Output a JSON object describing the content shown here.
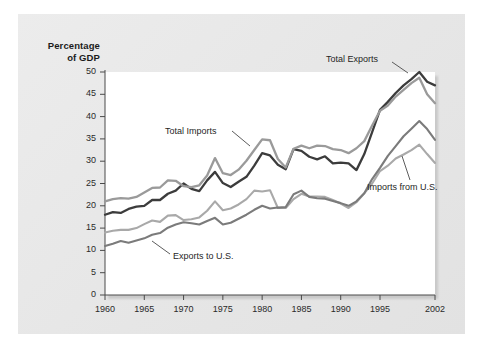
{
  "chart_data": {
    "type": "line",
    "title": "",
    "subtitle": "",
    "xlabel": "",
    "ylabel": "Percentage\nof GDP",
    "ylabel_lines": [
      "Percentage",
      "of GDP"
    ],
    "xlim": [
      1960,
      2002
    ],
    "ylim": [
      0,
      50
    ],
    "grid": false,
    "legend_position": "inline-annotations",
    "x_ticks": [
      1960,
      1965,
      1970,
      1975,
      1980,
      1985,
      1990,
      1995,
      2002
    ],
    "x_tick_labels": [
      "1960",
      "1965",
      "1970",
      "1975",
      "1980",
      "1985",
      "1990",
      "1995",
      "2002"
    ],
    "y_ticks": [
      0,
      5,
      10,
      15,
      20,
      25,
      30,
      35,
      40,
      45,
      50
    ],
    "y_tick_labels": [
      "0",
      "5",
      "10",
      "15",
      "20",
      "25",
      "30",
      "35",
      "40",
      "45",
      "50"
    ],
    "x": [
      1960,
      1961,
      1962,
      1963,
      1964,
      1965,
      1966,
      1967,
      1968,
      1969,
      1970,
      1971,
      1972,
      1973,
      1974,
      1975,
      1976,
      1977,
      1978,
      1979,
      1980,
      1981,
      1982,
      1983,
      1984,
      1985,
      1986,
      1987,
      1988,
      1989,
      1990,
      1991,
      1992,
      1993,
      1994,
      1995,
      1996,
      1997,
      1998,
      1999,
      2000,
      2001,
      2002
    ],
    "series": [
      {
        "name": "Total Exports",
        "color": "#3c3c3c",
        "width": 2.3,
        "values": [
          18.0,
          18.6,
          18.4,
          19.3,
          19.8,
          20.0,
          21.3,
          21.3,
          22.7,
          23.4,
          25.0,
          23.8,
          23.3,
          25.7,
          27.6,
          25.1,
          24.2,
          25.4,
          26.5,
          29.0,
          31.8,
          31.3,
          29.2,
          28.2,
          32.7,
          32.3,
          31.0,
          30.4,
          31.1,
          29.5,
          29.7,
          29.5,
          28.0,
          31.6,
          36.5,
          41.5,
          43.3,
          45.3,
          47.0,
          48.4,
          50.0,
          47.8,
          47.0
        ]
      },
      {
        "name": "Total Imports",
        "color": "#9a9a9a",
        "width": 2.3,
        "values": [
          21.0,
          21.5,
          21.7,
          21.6,
          22.0,
          23.0,
          24.0,
          24.1,
          25.7,
          25.6,
          24.4,
          24.2,
          24.6,
          26.8,
          30.7,
          27.3,
          26.9,
          28.1,
          30.1,
          32.5,
          34.9,
          34.7,
          30.5,
          28.6,
          32.8,
          33.5,
          32.9,
          33.5,
          33.4,
          32.7,
          32.5,
          31.8,
          32.9,
          34.5,
          38.0,
          41.3,
          42.5,
          44.5,
          46.0,
          47.5,
          48.7,
          45.0,
          43.0
        ]
      },
      {
        "name": "Imports from U.S.",
        "color": "#a9a9a9",
        "width": 2.1,
        "values": [
          14.0,
          14.4,
          14.6,
          14.6,
          15.0,
          15.9,
          16.7,
          16.4,
          17.8,
          17.9,
          16.8,
          17.0,
          17.4,
          18.9,
          21.0,
          19.0,
          19.4,
          20.3,
          21.5,
          23.4,
          23.2,
          23.5,
          19.5,
          19.5,
          21.5,
          22.7,
          22.1,
          22.1,
          22.0,
          21.3,
          20.5,
          19.5,
          20.8,
          22.8,
          25.0,
          27.8,
          29.0,
          30.6,
          31.5,
          32.5,
          33.7,
          31.6,
          29.6
        ]
      },
      {
        "name": "Exports to U.S.",
        "color": "#7b7b7b",
        "width": 2.1,
        "values": [
          11.0,
          11.5,
          12.1,
          11.7,
          12.2,
          12.7,
          13.5,
          13.9,
          15.1,
          15.8,
          16.3,
          16.1,
          15.8,
          16.6,
          17.3,
          15.8,
          16.2,
          17.1,
          18.0,
          19.1,
          20.0,
          19.4,
          19.6,
          19.7,
          22.6,
          23.4,
          22.0,
          21.7,
          21.6,
          21.1,
          20.6,
          20.0,
          21.0,
          22.8,
          26.0,
          28.5,
          31.2,
          33.4,
          35.6,
          37.3,
          39.0,
          37.2,
          34.8
        ]
      }
    ],
    "annotations": [
      {
        "text": "Total Exports",
        "target_x": 2000,
        "target_y": 50.0,
        "label_left_px": 326,
        "label_top_px": 54,
        "leader": [
          [
            392,
            62
          ],
          [
            408,
            73
          ]
        ]
      },
      {
        "text": "Total Imports",
        "target_x": 1978,
        "target_y": 30.1,
        "label_left_px": 165,
        "label_top_px": 126,
        "leader": [
          [
            232,
            131
          ],
          [
            250,
            146
          ]
        ]
      },
      {
        "text": "Imports from U.S.",
        "target_x": 1999,
        "target_y": 32.5,
        "label_left_px": 367,
        "label_top_px": 182,
        "leader": [
          [
            410,
            180
          ],
          [
            402,
            156
          ]
        ]
      },
      {
        "text": "Exports to U.S.",
        "target_x": 1967,
        "target_y": 13.9,
        "label_left_px": 173,
        "label_top_px": 251,
        "leader": [
          [
            170,
            254
          ],
          [
            152,
            241
          ]
        ]
      }
    ]
  },
  "colors": {
    "figure_background": "#e9e9e9",
    "plot_background": "#ffffff",
    "axis": "#4a4a4a",
    "text": "#1f1f1f",
    "total_exports": "#3c3c3c",
    "total_imports": "#9a9a9a",
    "imports_from_us": "#a9a9a9",
    "exports_to_us": "#7b7b7b"
  }
}
